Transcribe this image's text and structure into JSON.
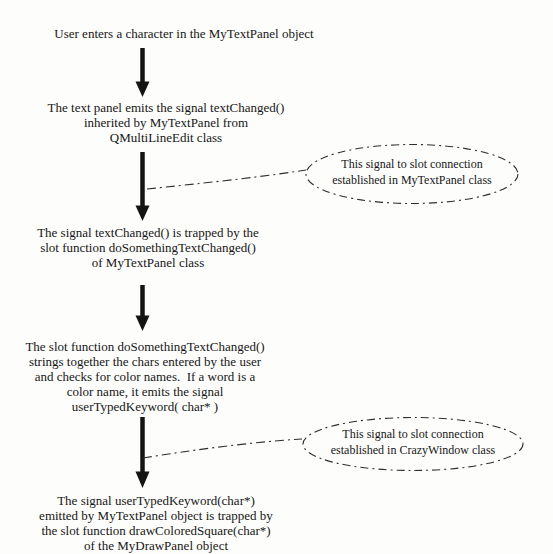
{
  "page": {
    "background_color": "#fdfdfc",
    "ink_color": "#1c1c1c",
    "line_color": "#2e2e2e"
  },
  "flow": {
    "steps": [
      {
        "text": "User enters a character in the MyTextPanel object"
      },
      {
        "text": "The text panel emits the signal textChanged()\ninherited by MyTextPanel from\nQMultiLineEdit class"
      },
      {
        "text": "The signal textChanged() is trapped by the\nslot function doSomethingTextChanged()\nof MyTextPanel class"
      },
      {
        "text": "The slot function doSomethingTextChanged()\nstrings together the chars entered by the user\nand checks for color names.  If a word is a\ncolor name, it emits the signal\nuserTypedKeyword( char* )"
      },
      {
        "text": "The signal userTypedKeyword(char*)\nemitted by MyTextPanel object is trapped by\nthe slot function drawColoredSquare(char*)\nof the MyDrawPanel object"
      }
    ]
  },
  "callouts": [
    {
      "text": "This signal to slot connection\nestablished in MyTextPanel class"
    },
    {
      "text": "This signal to slot connection\nestablished in CrazyWindow class"
    }
  ]
}
